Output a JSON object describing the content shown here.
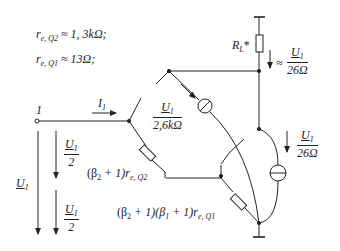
{
  "diagram": {
    "type": "circuit-schematic",
    "annotations": {
      "re_q2": {
        "symbol": "r",
        "sub": "e, Q2",
        "relation": "≈ 1, 3kΩ;"
      },
      "re_q1": {
        "symbol": "r",
        "sub": "e, Q1",
        "relation": "≈ 13Ω;"
      }
    },
    "node_label": "1",
    "input_current": {
      "symbol": "I",
      "sub": "1"
    },
    "load_resistor": {
      "symbol": "R",
      "sub": "L",
      "suffix": "*"
    },
    "load_current": {
      "prefix": "≈",
      "numerator": "U",
      "numerator_sub": "1",
      "denominator": "26Ω"
    },
    "q2_current": {
      "numerator": "U",
      "numerator_sub": "1",
      "denominator": "2,6kΩ"
    },
    "q1_current": {
      "numerator": "U",
      "numerator_sub": "1",
      "denominator": "26Ω"
    },
    "input_voltage": {
      "symbol": "U",
      "sub": "1"
    },
    "half_voltage_top": {
      "numerator": "U",
      "numerator_sub": "1",
      "denominator": "2"
    },
    "half_voltage_bottom": {
      "numerator": "U",
      "numerator_sub": "1",
      "denominator": "2"
    },
    "q2_input_resistance": {
      "open": "(β",
      "beta_sub": "2",
      "rest": " + 1)r",
      "r_sub": "e, Q2"
    },
    "q1_input_resistance": {
      "open": "(β",
      "beta_sub1": "2",
      "mid": " + 1)(β",
      "beta_sub2": "1",
      "rest": " + 1)r",
      "r_sub": "e, Q1"
    },
    "line_color": "#222222"
  }
}
